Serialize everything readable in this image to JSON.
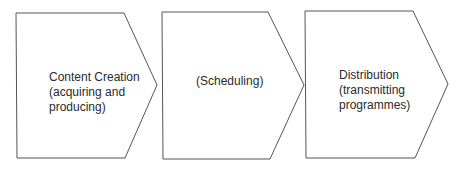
{
  "diagram": {
    "type": "process-chevron-flow",
    "stroke_color": "#555555",
    "text_color": "#2a2a2a",
    "steps": [
      {
        "lines": [
          "Content Creation",
          "(acquiring and",
          "producing)"
        ]
      },
      {
        "lines": [
          "(Scheduling)"
        ]
      },
      {
        "lines": [
          "Distribution",
          "(transmitting",
          "programmes)"
        ]
      }
    ]
  }
}
